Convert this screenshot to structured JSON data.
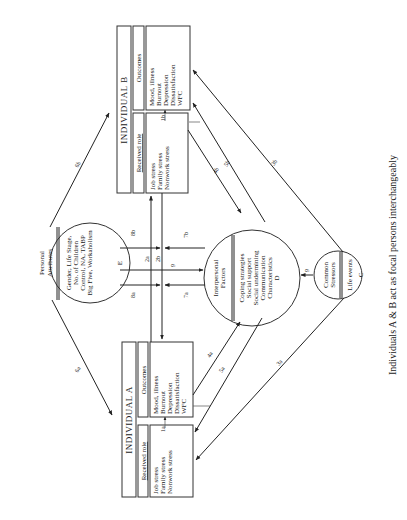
{
  "caption": "Individuals A & B act as focal persons interchangeably",
  "individual_a": {
    "title": "INDIVIDUAL  A",
    "received_role_header": "Received role",
    "outcomes_header": "Outcomes",
    "stressors": [
      "Job stress",
      "Family stress",
      "Nonwork stress"
    ],
    "outcomes": [
      "Mood, illness",
      "Burnout",
      "Depression",
      "Dissatisfaction",
      "WFC"
    ],
    "link_label": "1a"
  },
  "individual_b": {
    "title": "INDIVIDUAL  B",
    "received_role_header": "Received role",
    "outcomes_header": "Outcomes",
    "stressors": [
      "Job stress",
      "Family stress",
      "Nonwork stress"
    ],
    "outcomes": [
      "Mood, illness",
      "Burnout",
      "Depression",
      "Dissatisfaction",
      "WFC"
    ],
    "link_label": "1b"
  },
  "personal_attributes": {
    "title_lines": [
      "Personal",
      "Attributes"
    ],
    "items": [
      "Gender,  Life Stage,",
      "No. of Children",
      "Control, NA, TABP",
      "Big Five, Workaholism"
    ],
    "code": "E"
  },
  "interpersonal_factors": {
    "title_lines": [
      "Interpersonal",
      "Factors"
    ],
    "items": [
      "Coping strategies",
      "Social support",
      "Social undermining",
      "Communication",
      "Characteristics"
    ],
    "code": "D"
  },
  "common_stressors": {
    "title_lines": [
      "Common",
      "Stressors"
    ],
    "items": [
      "Life events"
    ],
    "code": "C"
  },
  "path_labels": {
    "p2a": "2a",
    "p2b": "2b",
    "p3a": "3a",
    "p3b": "3b",
    "p4a": "4a",
    "p4b": "4b",
    "p5a": "5a",
    "p5b": "5b",
    "p6a": "6a",
    "p6b": "6b",
    "p7a": "7a",
    "p7b": "7b",
    "p8a": "8a",
    "p8b": "8b",
    "p9": "9",
    "p9c": "9"
  }
}
